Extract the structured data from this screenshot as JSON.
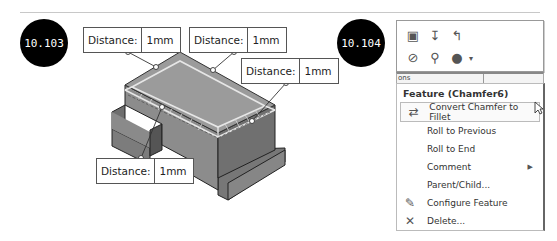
{
  "figures": [
    {
      "label": "10.103",
      "callouts": [
        {
          "label": "Distance:",
          "value": "1mm"
        },
        {
          "label": "Distance:",
          "value": "1mm"
        },
        {
          "label": "Distance:",
          "value": "1mm"
        },
        {
          "label": "Distance:",
          "value": "1mm"
        }
      ]
    },
    {
      "label": "10.104"
    }
  ],
  "toolbar": {
    "row1": [
      "edit-feature-icon",
      "rollback-icon",
      "undo-icon"
    ],
    "row2": [
      "hide-icon",
      "zoom-to-selection-icon",
      "appearance-icon"
    ],
    "dropdown_glyph": "▾"
  },
  "strip_text": "ons",
  "menu": {
    "title": "Feature (Chamfer6)",
    "items": [
      {
        "label": "Convert Chamfer to Fillet",
        "mnemonic_index": 0,
        "icon": "convert-icon",
        "highlighted": true
      },
      {
        "label": "Roll to Previous",
        "icon": ""
      },
      {
        "label": "Roll to End",
        "icon": ""
      },
      {
        "label": "Comment",
        "icon": "",
        "submenu": true
      },
      {
        "label": "Parent/Child...",
        "icon": ""
      },
      {
        "label": "Configure Feature",
        "icon": "configure-icon"
      },
      {
        "label": "Delete...",
        "icon": "delete-icon"
      }
    ]
  }
}
